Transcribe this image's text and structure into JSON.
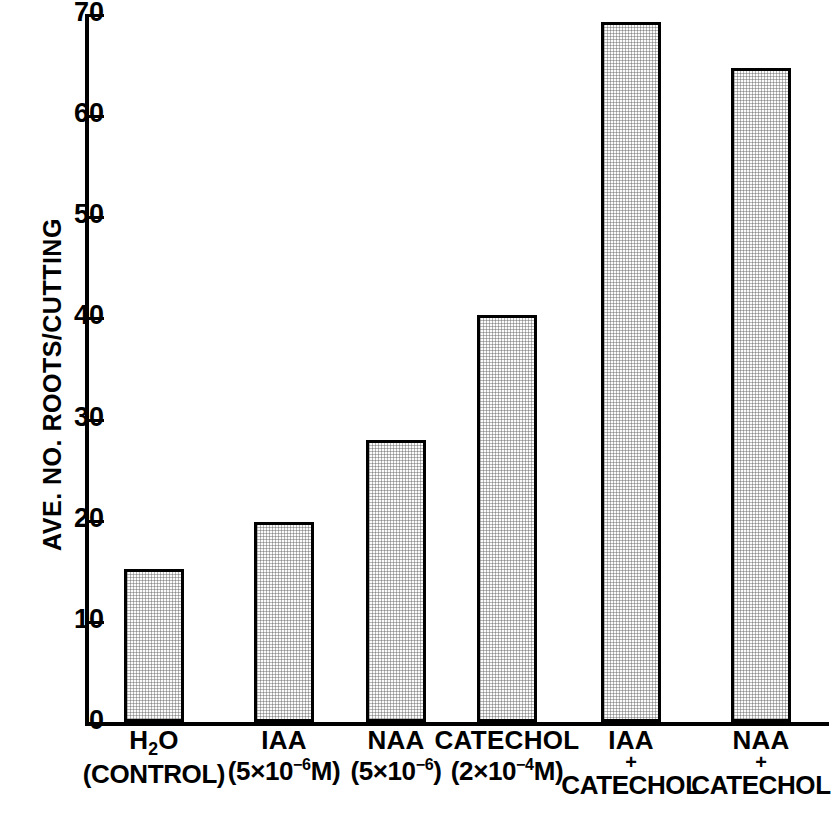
{
  "chart_data": {
    "type": "bar",
    "title": "",
    "xlabel": "",
    "ylabel": "AVE. NO. ROOTS/CUTTING",
    "ylim": [
      0,
      70
    ],
    "yticks": [
      0,
      10,
      20,
      30,
      40,
      50,
      60,
      70
    ],
    "grid": false,
    "legend": null,
    "categories": [
      "H2O (CONTROL)",
      "IAA (5x10-6 M)",
      "NAA (5x10-6)",
      "CATECHOL (2x10-4 M)",
      "IAA + CATECHOL",
      "NAA + CATECHOL"
    ],
    "values": [
      15.1,
      19.8,
      27.9,
      40.2,
      69.2,
      64.7
    ]
  },
  "axis": {
    "y_label": "AVE. NO. ROOTS/CUTTING",
    "ticks": [
      {
        "value": "70"
      },
      {
        "value": "60"
      },
      {
        "value": "50"
      },
      {
        "value": "40"
      },
      {
        "value": "30"
      },
      {
        "value": "20"
      },
      {
        "value": "10"
      },
      {
        "value": "0"
      }
    ]
  },
  "x_categories": [
    {
      "name": "h2o-control",
      "line1_pre": "H",
      "line1_sub": "2",
      "line1_post": "O",
      "plus": "",
      "line2_pre": "(CONTROL)",
      "line2_sup": "",
      "line2_post": ""
    },
    {
      "name": "iaa",
      "line1_pre": "IAA",
      "line1_sub": "",
      "line1_post": "",
      "plus": "",
      "line2_pre": "(5×10",
      "line2_sup": "−6",
      "line2_post": "M)"
    },
    {
      "name": "naa",
      "line1_pre": "NAA",
      "line1_sub": "",
      "line1_post": "",
      "plus": "",
      "line2_pre": "(5×10",
      "line2_sup": "−6",
      "line2_post": ")"
    },
    {
      "name": "catechol",
      "line1_pre": "CATECHOL",
      "line1_sub": "",
      "line1_post": "",
      "plus": "",
      "line2_pre": "(2×10",
      "line2_sup": "−4",
      "line2_post": "M)"
    },
    {
      "name": "iaa-plus-catechol",
      "line1_pre": "IAA",
      "line1_sub": "",
      "line1_post": "",
      "plus": "+",
      "line2_pre": "CATECHOL",
      "line2_sup": "",
      "line2_post": ""
    },
    {
      "name": "naa-plus-catechol",
      "line1_pre": "NAA",
      "line1_sub": "",
      "line1_post": "",
      "plus": "+",
      "line2_pre": "CATECHOL",
      "line2_sup": "",
      "line2_post": ""
    }
  ],
  "style": {
    "bar_fill": "#f2f2f2",
    "bar_stroke": "#000000",
    "axis_color": "#000000",
    "background": "#ffffff"
  }
}
